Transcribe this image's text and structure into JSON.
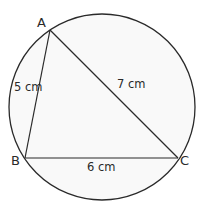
{
  "diagram": {
    "type": "triangle-inscribed-in-circle",
    "colors": {
      "stroke": "#2a2a2a",
      "circle_fill": "#f9f9f9",
      "background": "#ffffff",
      "text": "#2a2a2a"
    },
    "circle": {
      "cx": 102,
      "cy": 107,
      "r": 93
    },
    "vertices": [
      {
        "id": "A",
        "label": "A",
        "x": 50,
        "y": 30
      },
      {
        "id": "B",
        "label": "B",
        "x": 25,
        "y": 158
      },
      {
        "id": "C",
        "label": "C",
        "x": 178,
        "y": 158
      }
    ],
    "sides": [
      {
        "id": "AB",
        "from": "A",
        "to": "B",
        "length_label": "5 cm"
      },
      {
        "id": "AC",
        "from": "A",
        "to": "C",
        "length_label": "7 cm"
      },
      {
        "id": "BC",
        "from": "B",
        "to": "C",
        "length_label": "6 cm"
      }
    ]
  }
}
